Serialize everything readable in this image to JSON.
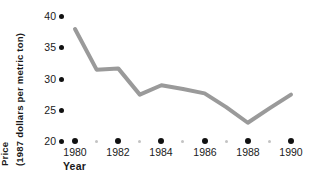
{
  "chart_data": {
    "type": "line",
    "title": "",
    "xlabel": "Year",
    "ylabel": "Price\n(1987 dollars per metric ton)",
    "ylabel_lines": [
      "Price",
      "(1987 dollars per metric ton)"
    ],
    "x": [
      1980,
      1981,
      1982,
      1983,
      1984,
      1985,
      1986,
      1987,
      1988,
      1989,
      1990
    ],
    "values": [
      38.0,
      31.5,
      31.7,
      27.5,
      29.0,
      28.4,
      27.7,
      25.5,
      23.0,
      25.3,
      27.5
    ],
    "series": [
      {
        "name": "Price",
        "values": [
          38.0,
          31.5,
          31.7,
          27.5,
          29.0,
          28.4,
          27.7,
          25.5,
          23.0,
          25.3,
          27.5
        ]
      }
    ],
    "xlim": [
      1979.6,
      1990.4
    ],
    "ylim": [
      20,
      40
    ],
    "yticks": [
      20,
      25,
      30,
      35,
      40
    ],
    "ytick_labels": [
      "20",
      "25",
      "30",
      "35",
      "40"
    ],
    "xticks": [
      1980,
      1982,
      1984,
      1986,
      1988,
      1990
    ],
    "xtick_labels": [
      "1980",
      "1982",
      "1984",
      "1986",
      "1988",
      "1990"
    ],
    "xticks_minor": [
      1981,
      1983,
      1985,
      1987,
      1989
    ],
    "grid": false,
    "legend": false,
    "legend_position": "none",
    "line_color": "#9a9a9a",
    "line_width_px": 4,
    "tick_major_color": "#111111",
    "tick_minor_color": "#c3c3c3",
    "text_color": "#1a1a1a",
    "background": "#ffffff"
  }
}
